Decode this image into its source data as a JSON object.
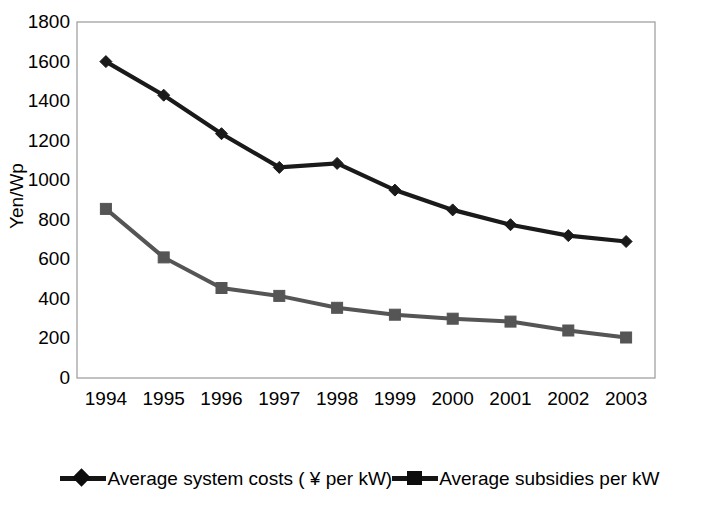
{
  "chart_data": {
    "type": "line",
    "title": "",
    "xlabel": "",
    "ylabel": "Yen/Wp",
    "categories": [
      "1994",
      "1995",
      "1996",
      "1997",
      "1998",
      "1999",
      "2000",
      "2001",
      "2002",
      "2003"
    ],
    "ylim": [
      0,
      1800
    ],
    "ytick_step": 200,
    "yticks": [
      "1800",
      "1600",
      "1400",
      "1200",
      "1000",
      "800",
      "600",
      "400",
      "200",
      "0"
    ],
    "ytick_values": [
      1800,
      1600,
      1400,
      1200,
      1000,
      800,
      600,
      400,
      200,
      0
    ],
    "grid": false,
    "legend_position": "bottom",
    "series": [
      {
        "name": "Average system costs ( ¥ per kW)",
        "marker": "diamond",
        "color": "#1a1a1a",
        "values": [
          1600,
          1430,
          1235,
          1065,
          1085,
          950,
          850,
          775,
          720,
          690
        ]
      },
      {
        "name": "Average subsidies per kW",
        "marker": "square",
        "color": "#555555",
        "values": [
          855,
          610,
          455,
          415,
          355,
          320,
          300,
          285,
          240,
          205
        ]
      }
    ]
  },
  "legend": {
    "entries": [
      {
        "label": "Average system costs ( ¥ per kW)",
        "marker": "diamond-marker"
      },
      {
        "label": "Average subsidies per kW",
        "marker": "square-marker"
      }
    ]
  },
  "axes": {
    "y_title": "Yen/Wp"
  },
  "colors": {
    "series_1": "#1a1a1a",
    "series_2": "#555555",
    "frame": "#999999",
    "background": "#ffffff"
  }
}
